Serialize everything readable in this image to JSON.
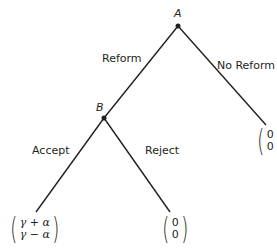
{
  "diagram": {
    "type": "extensive-form game tree",
    "nodes": {
      "A": {
        "label": "A"
      },
      "B": {
        "label": "B"
      }
    },
    "edges": {
      "reform": {
        "label": "Reform"
      },
      "no_reform": {
        "label": "No Reform"
      },
      "accept": {
        "label": "Accept"
      },
      "reject": {
        "label": "Reject"
      }
    },
    "payoffs": {
      "accept": {
        "top": "γ + α",
        "bottom": "γ − α"
      },
      "reject": {
        "top": "0",
        "bottom": "0"
      },
      "no_reform": {
        "top": "0",
        "bottom": "0"
      }
    },
    "colors": {
      "line": "#231f20",
      "background": "#ffffff"
    }
  }
}
